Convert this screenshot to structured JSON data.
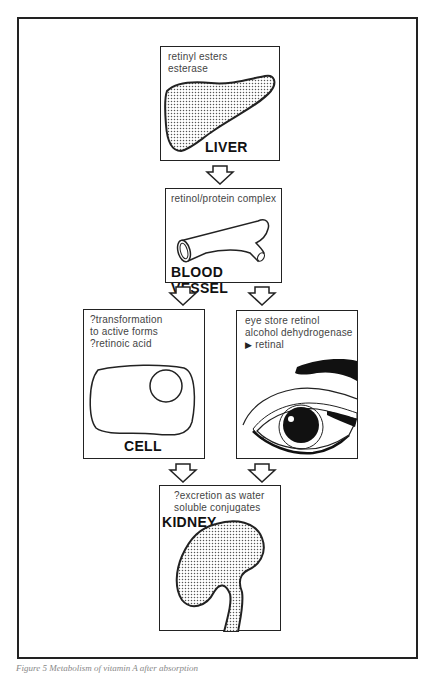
{
  "figure": {
    "caption": "Figure 5  Metabolism of vitamin A after absorption"
  },
  "nodes": {
    "liver": {
      "label": "LIVER",
      "note": "retinyl esters\nesterase"
    },
    "blood_vessel": {
      "label": "BLOOD VESSEL",
      "note": "retinol/protein complex"
    },
    "cell": {
      "label": "CELL",
      "note": "?transformation\nto active forms\n?retinoic acid"
    },
    "eye": {
      "label": "",
      "note_lines": [
        "eye store retinol",
        "alcohol dehydrogenase",
        "retinal"
      ],
      "arrow_glyph": "▶"
    },
    "kidney": {
      "label": "KIDNEY",
      "note": "?excretion as water\nsoluble conjugates"
    }
  },
  "edges": [
    {
      "from": "liver",
      "to": "blood_vessel"
    },
    {
      "from": "blood_vessel",
      "to": "cell"
    },
    {
      "from": "blood_vessel",
      "to": "eye"
    },
    {
      "from": "cell",
      "to": "kidney"
    },
    {
      "from": "eye",
      "to": "kidney"
    }
  ],
  "colors": {
    "line": "#222222",
    "stipple": "#555555",
    "background": "#ffffff"
  }
}
